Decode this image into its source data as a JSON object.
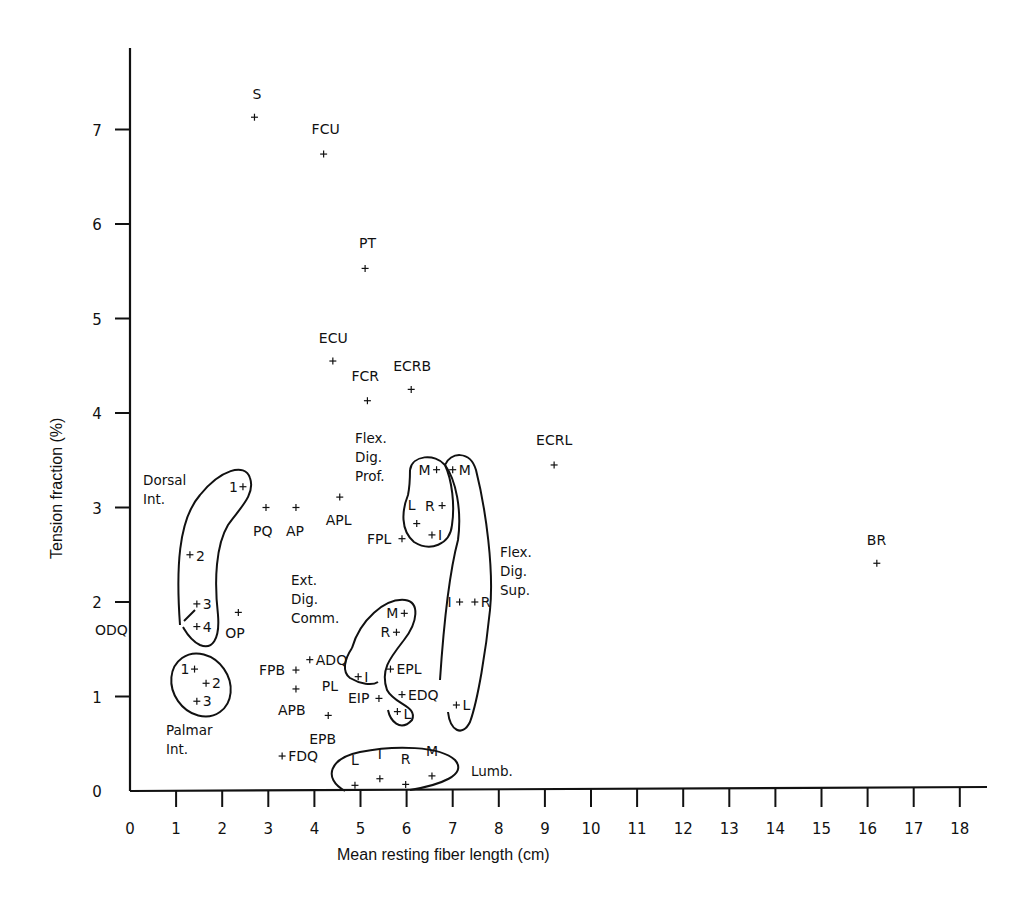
{
  "chart_data": {
    "type": "scatter",
    "title": "",
    "xlabel": "Mean resting fiber length (cm)",
    "ylabel": "Tension fraction (%)",
    "xlim": [
      0,
      18
    ],
    "ylim": [
      0,
      7.5
    ],
    "xticks": [
      "0",
      "1",
      "2",
      "3",
      "4",
      "5",
      "6",
      "7",
      "8",
      "9",
      "10",
      "11",
      "12",
      "13",
      "14",
      "15",
      "16",
      "17",
      "18"
    ],
    "yticks": [
      "0",
      "1",
      "2",
      "3",
      "4",
      "5",
      "6",
      "7"
    ],
    "grid": false,
    "legend": null,
    "points": [
      {
        "label": "S",
        "x": 2.7,
        "y": 7.13,
        "lx": -2,
        "ly": -18
      },
      {
        "label": "FCU",
        "x": 4.2,
        "y": 6.74,
        "lx": -12,
        "ly": -20
      },
      {
        "label": "PT",
        "x": 5.1,
        "y": 5.53,
        "lx": -6,
        "ly": -20
      },
      {
        "label": "ECU",
        "x": 4.4,
        "y": 4.55,
        "lx": -14,
        "ly": -18
      },
      {
        "label": "FCR",
        "x": 5.15,
        "y": 4.13,
        "lx": -16,
        "ly": -20
      },
      {
        "label": "ECRB",
        "x": 6.1,
        "y": 4.25,
        "lx": -18,
        "ly": -18
      },
      {
        "label": "ECRL",
        "x": 9.2,
        "y": 3.45,
        "lx": -18,
        "ly": -20
      },
      {
        "label": "BR",
        "x": 16.2,
        "y": 2.41,
        "lx": -10,
        "ly": -18
      },
      {
        "label": "APL",
        "x": 4.55,
        "y": 3.11,
        "lx": -14,
        "ly": 28
      },
      {
        "label": "PQ",
        "x": 2.95,
        "y": 3.0,
        "lx": -13,
        "ly": 28
      },
      {
        "label": "AP",
        "x": 3.6,
        "y": 3.0,
        "lx": -10,
        "ly": 28
      },
      {
        "label": "FPL",
        "x": 5.9,
        "y": 2.67,
        "lx": -35,
        "ly": 5
      },
      {
        "label": "OP",
        "x": 2.35,
        "y": 1.89,
        "lx": -13,
        "ly": 26
      },
      {
        "label": "FPB",
        "x": 3.6,
        "y": 1.28,
        "lx": -37,
        "ly": 5
      },
      {
        "label": "ADQ",
        "x": 3.9,
        "y": 1.39,
        "lx": 6,
        "ly": 5
      },
      {
        "label": "PL",
        "x": 4.55,
        "y": 1.2,
        "lx": -18,
        "ly": 13,
        "nomark": true
      },
      {
        "label": "APB",
        "x": 3.6,
        "y": 1.08,
        "lx": -18,
        "ly": 26
      },
      {
        "label": "EPB",
        "x": 4.3,
        "y": 0.8,
        "lx": -19,
        "ly": 29
      },
      {
        "label": "FDQ",
        "x": 3.3,
        "y": 0.37,
        "lx": 6,
        "ly": 5
      },
      {
        "label": "EPL",
        "x": 5.65,
        "y": 1.29,
        "lx": 6,
        "ly": 5
      },
      {
        "label": "EDQ",
        "x": 5.9,
        "y": 1.02,
        "lx": 6,
        "ly": 5
      },
      {
        "label": "EIP",
        "x": 5.4,
        "y": 0.98,
        "lx": -31,
        "ly": 5
      },
      {
        "label": "ODQ",
        "x": 1.15,
        "y": 1.8,
        "lx": -88,
        "ly": 14,
        "nomark": true
      }
    ],
    "groups": [
      {
        "name": "Dorsal Int.",
        "label_lines": [
          "Dorsal",
          "Int."
        ],
        "label_pos": [
          143,
          485
        ],
        "points": [
          {
            "label": "1",
            "x": 2.45,
            "y": 3.22,
            "lx": -14,
            "ly": 5
          },
          {
            "label": "2",
            "x": 1.3,
            "y": 2.5,
            "lx": 6,
            "ly": 6
          },
          {
            "label": "3",
            "x": 1.45,
            "y": 1.98,
            "lx": 6,
            "ly": 5
          },
          {
            "label": "4",
            "x": 1.45,
            "y": 1.74,
            "lx": 6,
            "ly": 5
          }
        ]
      },
      {
        "name": "Palmar Int.",
        "label_lines": [
          "Palmar",
          "Int."
        ],
        "label_pos": [
          166,
          735
        ],
        "points": [
          {
            "label": "1",
            "x": 1.4,
            "y": 1.29,
            "lx": -14,
            "ly": 5
          },
          {
            "label": "2",
            "x": 1.65,
            "y": 1.14,
            "lx": 6,
            "ly": 5
          },
          {
            "label": "3",
            "x": 1.45,
            "y": 0.95,
            "lx": 6,
            "ly": 5
          }
        ]
      },
      {
        "name": "Flex. Dig. Prof.",
        "label_lines": [
          "Flex.",
          "Dig.",
          "Prof."
        ],
        "label_pos": [
          355,
          443
        ],
        "points": [
          {
            "label": "M",
            "x": 6.65,
            "y": 3.4,
            "lx": -18,
            "ly": 5
          },
          {
            "label": "L",
            "x": 6.22,
            "y": 2.83,
            "lx": -9,
            "ly": -14
          },
          {
            "label": "R",
            "x": 6.77,
            "y": 3.02,
            "lx": -17,
            "ly": 5
          },
          {
            "label": "I",
            "x": 6.55,
            "y": 2.71,
            "lx": 6,
            "ly": 5
          }
        ]
      },
      {
        "name": "Flex. Dig. Sup.",
        "label_lines": [
          "Flex.",
          "Dig.",
          "Sup."
        ],
        "label_pos": [
          500,
          557
        ],
        "points": [
          {
            "label": "M",
            "x": 7.0,
            "y": 3.4,
            "lx": 6,
            "ly": 5
          },
          {
            "label": "I",
            "x": 7.15,
            "y": 2.0,
            "lx": -12,
            "ly": 5
          },
          {
            "label": "R",
            "x": 7.48,
            "y": 2.0,
            "lx": 6,
            "ly": 5
          },
          {
            "label": "L",
            "x": 7.08,
            "y": 0.91,
            "lx": 6,
            "ly": 5
          }
        ]
      },
      {
        "name": "Ext. Dig. Comm.",
        "label_lines": [
          "Ext.",
          "Dig.",
          "Comm."
        ],
        "label_pos": [
          291,
          585
        ],
        "points": [
          {
            "label": "M",
            "x": 5.95,
            "y": 1.88,
            "lx": -18,
            "ly": 5
          },
          {
            "label": "R",
            "x": 5.78,
            "y": 1.68,
            "lx": -16,
            "ly": 5
          },
          {
            "label": "I",
            "x": 4.95,
            "y": 1.21,
            "lx": 6,
            "ly": 5
          },
          {
            "label": "L",
            "x": 5.8,
            "y": 0.84,
            "lx": 6,
            "ly": 7
          }
        ]
      },
      {
        "name": "Lumb.",
        "label_lines": [
          "Lumb."
        ],
        "label_pos": [
          471,
          776
        ],
        "points": [
          {
            "label": "L",
            "x": 4.88,
            "y": 0.06,
            "lx": -4,
            "ly": -20
          },
          {
            "label": "I",
            "x": 5.42,
            "y": 0.13,
            "lx": -2,
            "ly": -20
          },
          {
            "label": "R",
            "x": 5.98,
            "y": 0.07,
            "lx": -5,
            "ly": -20
          },
          {
            "label": "M",
            "x": 6.55,
            "y": 0.16,
            "lx": -6,
            "ly": -20
          }
        ]
      }
    ]
  }
}
